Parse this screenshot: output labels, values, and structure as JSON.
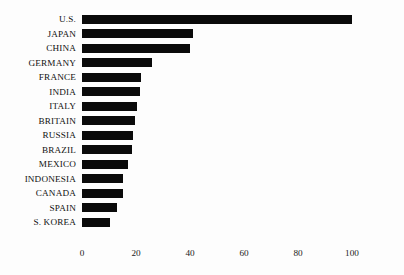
{
  "chart_data": {
    "type": "bar",
    "orientation": "horizontal",
    "title": "",
    "subtitle": "",
    "xlabel": "",
    "ylabel": "",
    "xlim": [
      0,
      110
    ],
    "grid": false,
    "legend": false,
    "bar_color": "#0a0a0a",
    "background_color": "#fdfdfd",
    "axis_ticks": [
      "0",
      "20",
      "40",
      "60",
      "80",
      "100"
    ],
    "axis_tick_values": [
      0,
      20,
      40,
      60,
      80,
      100
    ],
    "categories": [
      "U.S.",
      "JAPAN",
      "CHINA",
      "GERMANY",
      "FRANCE",
      "INDIA",
      "ITALY",
      "BRITAIN",
      "RUSSIA",
      "BRAZIL",
      "MEXICO",
      "INDONESIA",
      "CANADA",
      "SPAIN",
      "S. KOREA"
    ],
    "values": [
      100,
      41,
      40,
      26,
      22,
      21.5,
      20.5,
      19.5,
      19,
      18.5,
      17,
      15,
      15,
      13,
      10.5
    ]
  }
}
